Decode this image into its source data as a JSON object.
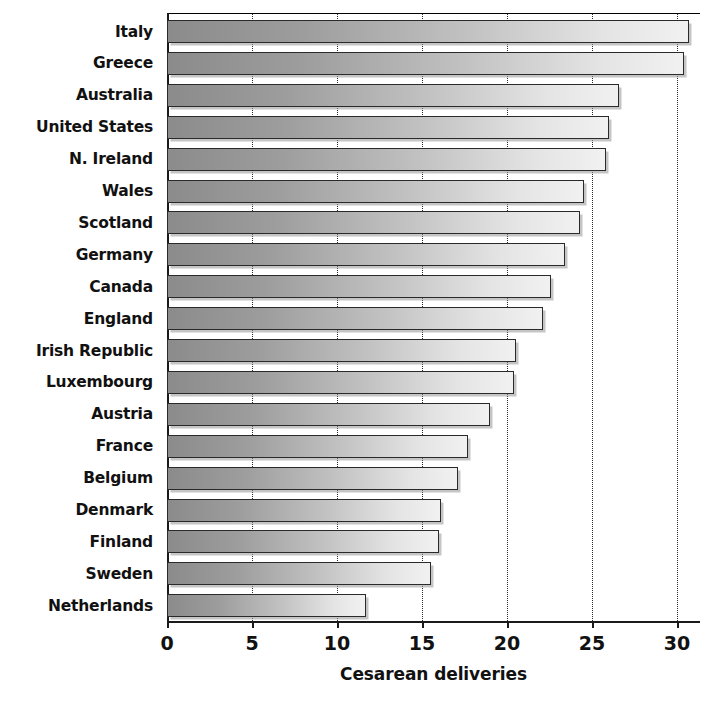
{
  "chart_data": {
    "type": "bar",
    "orientation": "horizontal",
    "title": "",
    "xlabel": "Cesarean deliveries",
    "ylabel": "",
    "xlim": [
      0,
      31.5
    ],
    "xticks": [
      0,
      5,
      10,
      15,
      20,
      25,
      30
    ],
    "xtick_labels": [
      "0",
      "5",
      "10",
      "15",
      "20",
      "25",
      "30"
    ],
    "grid": "vertical-dotted",
    "legend": "none",
    "categories": [
      "Italy",
      "Greece",
      "Australia",
      "United States",
      "N. Ireland",
      "Wales",
      "Scotland",
      "Germany",
      "Canada",
      "England",
      "Irish Republic",
      "Luxembourg",
      "Austria",
      "France",
      "Belgium",
      "Denmark",
      "Finland",
      "Sweden",
      "Netherlands"
    ],
    "values": [
      30.7,
      30.4,
      26.6,
      26.0,
      25.8,
      24.5,
      24.3,
      23.4,
      22.6,
      22.1,
      20.5,
      20.4,
      19.0,
      17.7,
      17.1,
      16.1,
      16.0,
      15.5,
      11.7
    ],
    "bar_style": {
      "fill_gradient_from": "#8b8b8b",
      "fill_gradient_to": "#f1f1f1",
      "border_color": "#2a2a2a",
      "shadow_color": "#969696"
    }
  }
}
